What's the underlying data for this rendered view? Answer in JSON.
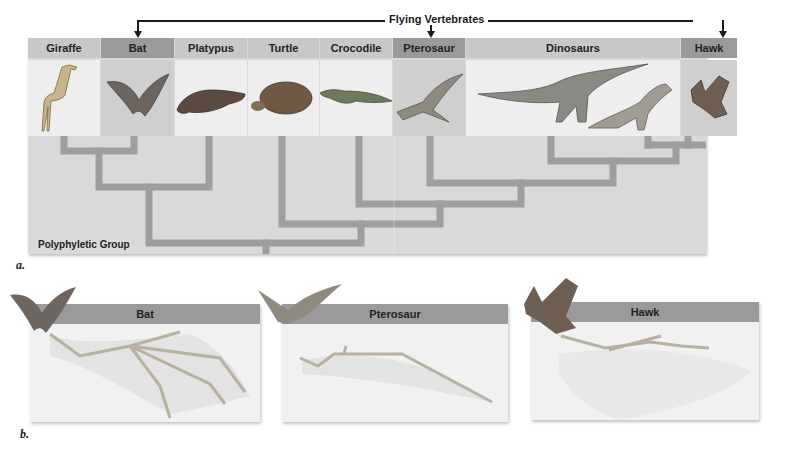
{
  "figure": {
    "bracket_label": "Flying Vertebrates",
    "panel_a": {
      "caption": "a.",
      "group_label": "Polyphyletic Group",
      "columns": [
        {
          "label": "Giraffe",
          "flying": false
        },
        {
          "label": "Bat",
          "flying": true
        },
        {
          "label": "Platypus",
          "flying": false
        },
        {
          "label": "Turtle",
          "flying": false
        },
        {
          "label": "Crocodile",
          "flying": false
        },
        {
          "label": "Pterosaur",
          "flying": true
        },
        {
          "label": "Dinosaurs",
          "flying": false
        },
        {
          "label": "Hawk",
          "flying": true
        }
      ]
    },
    "panel_b": {
      "caption": "b.",
      "wings": [
        {
          "label": "Bat"
        },
        {
          "label": "Pterosaur"
        },
        {
          "label": "Hawk"
        }
      ]
    },
    "colors": {
      "highlight_header": "#9a9a9a",
      "normal_header": "#c8c8c8",
      "tree_branch": "#9e9e9e",
      "panel_bg": "#d9d9d9"
    }
  }
}
